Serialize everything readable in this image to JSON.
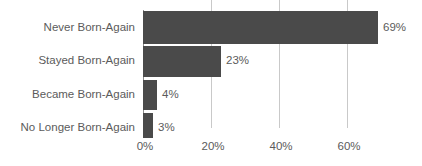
{
  "chart_data": {
    "type": "bar",
    "orientation": "horizontal",
    "title": "",
    "subtitle": "",
    "xlabel": "",
    "ylabel": "",
    "categories": [
      "Never Born-Again",
      "Stayed Born-Again",
      "Became Born-Again",
      "No Longer Born-Again"
    ],
    "values": [
      69,
      23,
      4,
      3
    ],
    "value_labels": [
      "69%",
      "23%",
      "4%",
      "3%"
    ],
    "xlim": [
      0,
      80
    ],
    "xticks": [
      0,
      20,
      40,
      60
    ],
    "xtick_labels": [
      "0%",
      "20%",
      "40%",
      "60%"
    ],
    "grid": "vertical",
    "legend": "none",
    "bar_color": "#4a4a4a",
    "gridline_color": "#c9c9c9",
    "axis_color": "#8d8d8d",
    "text_color": "#5b5b5b",
    "background_color": "#ffffff"
  },
  "bars": [
    {
      "label": "Never Born-Again",
      "value": 69,
      "value_label": "69%"
    },
    {
      "label": "Stayed Born-Again",
      "value": 23,
      "value_label": "23%"
    },
    {
      "label": "Became Born-Again",
      "value": 4,
      "value_label": "4%"
    },
    {
      "label": "No Longer Born-Again",
      "value": 3,
      "value_label": "3%"
    }
  ],
  "axis": {
    "ticks": [
      {
        "label": "0%"
      },
      {
        "label": "20%"
      },
      {
        "label": "40%"
      },
      {
        "label": "60%"
      }
    ]
  }
}
